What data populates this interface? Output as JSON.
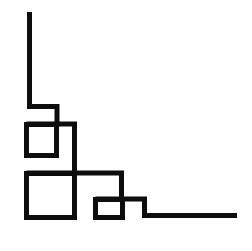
{
  "figure": {
    "width": 252,
    "height": 251,
    "background_color": "#ffffff",
    "stroke_color": "#0d0d0d",
    "stroke_width": 5,
    "shapes": [
      {
        "name": "left-vertical-and-upper-step",
        "type": "polyline",
        "points": "29.5,12 29.5,106.5 57,106.5 57,126.5"
      },
      {
        "name": "upper-small-square",
        "type": "rect",
        "x": 26.5,
        "y": 124.5,
        "width": 30,
        "height": 31
      },
      {
        "name": "mid-horizontal-and-descender",
        "type": "polyline",
        "points": "26.5,124 74.5,124 74.5,173.5"
      },
      {
        "name": "lower-large-square",
        "type": "rect",
        "x": 26.5,
        "y": 173.5,
        "width": 48,
        "height": 44
      },
      {
        "name": "mid-shelf-and-descender",
        "type": "polyline",
        "points": "26.5,173 121.5,173 121.5,199.5"
      },
      {
        "name": "lower-small-square",
        "type": "rect",
        "x": 95.5,
        "y": 199.5,
        "width": 27,
        "height": 18
      },
      {
        "name": "bottom-step-and-baseline",
        "type": "polyline",
        "points": "95.5,199 144.5,199 144.5,215.5 237,215.5"
      }
    ]
  }
}
